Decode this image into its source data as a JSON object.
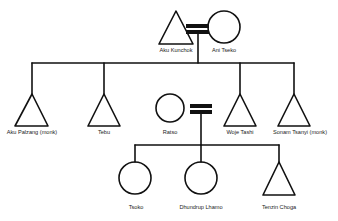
{
  "diagram": {
    "type": "family-tree",
    "colors": {
      "line": "#111111",
      "background": "#ffffff",
      "marriage_bar": "#111111"
    },
    "legend": {
      "triangle": "male",
      "circle": "female",
      "double-bar": "marriage"
    },
    "generation_1": {
      "husband": {
        "name": "Aku Kunchok",
        "shape": "triangle"
      },
      "wife": {
        "name": "Ani Tseko",
        "shape": "circle"
      }
    },
    "generation_2": [
      {
        "name": "Aku Palzang (monk)",
        "shape": "triangle"
      },
      {
        "name": "Tebu",
        "shape": "triangle"
      },
      {
        "name": "Ratso",
        "shape": "circle",
        "role": "spouse of Woje Tashi"
      },
      {
        "name": "Woje Tashi",
        "shape": "triangle"
      },
      {
        "name": "Sonam Tsanyi (monk)",
        "shape": "triangle"
      }
    ],
    "generation_3": [
      {
        "name": "Tsoko",
        "shape": "circle"
      },
      {
        "name": "Dhundrup Lhamo",
        "shape": "circle"
      },
      {
        "name": "Tenzin Choga",
        "shape": "triangle"
      }
    ]
  }
}
